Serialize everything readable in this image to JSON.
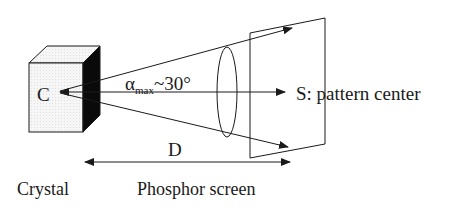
{
  "diagram": {
    "type": "EBSD / Kikuchi pattern geometry",
    "labels": {
      "crystal_center": "C",
      "angle_symbol": "α",
      "angle_subscript": "max",
      "angle_value": "~30°",
      "pattern_center": "S: pattern center",
      "distance": "D",
      "crystal": "Crystal",
      "screen": "Phosphor screen"
    },
    "colors": {
      "line": "#1a1a1a",
      "cube_front": "#f4f4f4",
      "cube_side": "#0a0a0a",
      "background": "#ffffff"
    }
  }
}
